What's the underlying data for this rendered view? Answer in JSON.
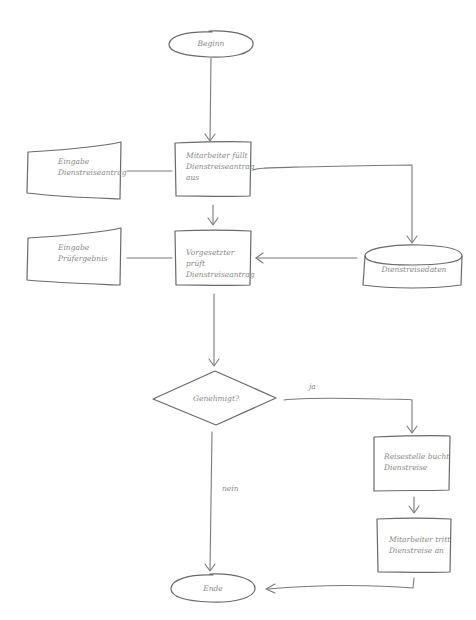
{
  "diagram": {
    "type": "flowchart",
    "style": "hand-drawn sketch",
    "stroke_color": "#6a6a6a",
    "text_color": "#8a8a8a",
    "nodes": {
      "start": {
        "shape": "ellipse",
        "label": "Beginn"
      },
      "fill_request": {
        "shape": "rectangle",
        "label": "Mitarbeiter füllt\nDienstreiseantrag\naus"
      },
      "input_request": {
        "shape": "manual-input",
        "label": "Eingabe\nDienstreiseantrag"
      },
      "input_check": {
        "shape": "manual-input",
        "label": "Eingabe\nPrüfergebnis"
      },
      "supervisor_check": {
        "shape": "rectangle",
        "label": "Vorgesetzter prüft\nDienstreiseantrag"
      },
      "travel_data": {
        "shape": "database",
        "label": "Dienstreisedaten"
      },
      "approved": {
        "shape": "diamond",
        "label": "Genehmigt?"
      },
      "book_trip": {
        "shape": "rectangle",
        "label": "Reisestelle bucht\nDienstreise"
      },
      "start_trip": {
        "shape": "rectangle",
        "label": "Mitarbeiter tritt\nDienstreise an"
      },
      "end": {
        "shape": "ellipse",
        "label": "Ende"
      }
    },
    "edges": {
      "yes": {
        "from": "approved",
        "to": "book_trip",
        "label": "ja"
      },
      "no": {
        "from": "approved",
        "to": "end",
        "label": "nein"
      }
    }
  }
}
